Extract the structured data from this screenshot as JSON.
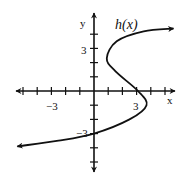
{
  "chart_data": {
    "type": "line",
    "title": "h(x)",
    "xlabel": "x",
    "ylabel": "y",
    "xlim": [
      -5.5,
      5.8
    ],
    "ylim": [
      -5.7,
      5.5
    ],
    "grid": false,
    "x_ticks": [
      -5,
      -4,
      -3,
      -2,
      -1,
      1,
      2,
      3,
      4,
      5
    ],
    "y_ticks": [
      -5,
      -4,
      -3,
      -2,
      -1,
      1,
      2,
      3,
      4
    ],
    "x_tick_labels": [
      {
        "value": -3,
        "label": "−3"
      },
      {
        "value": 3,
        "label": "3"
      }
    ],
    "y_tick_labels": [
      {
        "value": 3,
        "label": "3"
      },
      {
        "value": -3,
        "label": "−3"
      }
    ],
    "series": [
      {
        "name": "h(x)",
        "points": [
          {
            "x": -5.4,
            "y": -3.9
          },
          {
            "x": -2.5,
            "y": -3.5
          },
          {
            "x": 0,
            "y": -3
          },
          {
            "x": 2.5,
            "y": -2.0
          },
          {
            "x": 3.7,
            "y": -1.0
          },
          {
            "x": 3.1,
            "y": 0
          },
          {
            "x": 1.5,
            "y": 1.4
          },
          {
            "x": 0.9,
            "y": 2.3
          },
          {
            "x": 1.6,
            "y": 3.5
          },
          {
            "x": 3.5,
            "y": 4.2
          },
          {
            "x": 5.6,
            "y": 4.4
          }
        ],
        "arrows": [
          "start",
          "end"
        ],
        "color": "#111111"
      }
    ]
  },
  "labels": {
    "x_axis": "x",
    "y_axis": "y",
    "curve": "h(x)",
    "x_neg3": "−3",
    "x_pos3": "3",
    "y_pos3": "3",
    "y_neg3": "−3"
  }
}
